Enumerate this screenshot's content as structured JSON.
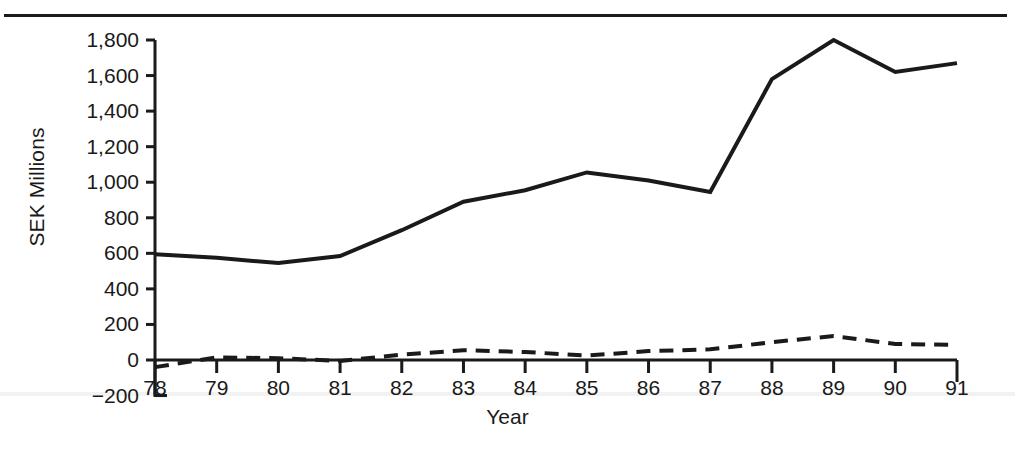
{
  "figure": {
    "top_rule": "horizontal-rule",
    "ink_color": "#1a1a1a",
    "background": "#ffffff"
  },
  "chart_data": {
    "type": "line",
    "title": "",
    "subtitle": "",
    "xlabel": "Year",
    "ylabel": "SEK Millions",
    "x": [
      78,
      79,
      80,
      81,
      82,
      83,
      84,
      85,
      86,
      87,
      88,
      89,
      90,
      91
    ],
    "categories": [
      "78",
      "79",
      "80",
      "81",
      "82",
      "83",
      "84",
      "85",
      "86",
      "87",
      "88",
      "89",
      "90",
      "91"
    ],
    "xlim": [
      78,
      91
    ],
    "ylim": [
      -200,
      1800
    ],
    "yticks": [
      -200,
      0,
      200,
      400,
      600,
      800,
      1000,
      1200,
      1400,
      1600,
      1800
    ],
    "ytick_labels": [
      "−200",
      "0",
      "200",
      "400",
      "600",
      "800",
      "1,000",
      "1,200",
      "1,400",
      "1,600",
      "1,800"
    ],
    "grid": false,
    "legend": false,
    "legend_position": "none",
    "series": [
      {
        "name": "solid-series",
        "style": "solid",
        "color": "#1a1a1a",
        "width": 4,
        "values": [
          595,
          575,
          545,
          585,
          730,
          890,
          955,
          1055,
          1010,
          945,
          1580,
          1800,
          1620,
          1670
        ]
      },
      {
        "name": "dashed-series",
        "style": "dashed",
        "color": "#1a1a1a",
        "width": 4,
        "values": [
          -40,
          15,
          10,
          -5,
          30,
          55,
          45,
          25,
          50,
          60,
          100,
          135,
          90,
          85
        ]
      }
    ]
  },
  "axes": {
    "y_axis_name": "y-axis",
    "x_axis_name": "x-axis",
    "tick_direction": "outward"
  }
}
